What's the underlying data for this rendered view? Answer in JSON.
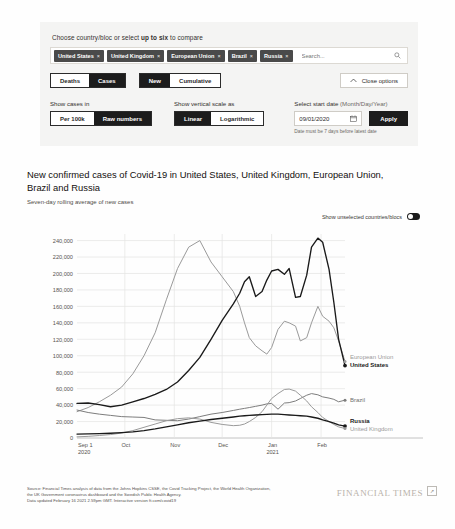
{
  "options": {
    "heading_prefix": "Choose country/bloc or select ",
    "heading_bold": "up to six",
    "heading_suffix": " to compare",
    "chips": [
      {
        "label": "United States",
        "remove": "×"
      },
      {
        "label": "United Kingdom",
        "remove": "×"
      },
      {
        "label": "European Union",
        "remove": "×"
      },
      {
        "label": "Brazil",
        "remove": "×"
      },
      {
        "label": "Russia",
        "remove": "×"
      }
    ],
    "search_placeholder": "Search...",
    "search_value": "",
    "metric_toggle": {
      "options": [
        "Deaths",
        "Cases"
      ],
      "selected": "Cases"
    },
    "count_toggle": {
      "options": [
        "New",
        "Cumulative"
      ],
      "selected": "New"
    },
    "close_options_label": "Close options",
    "show_cases_label": "Show cases in",
    "cases_toggle": {
      "options": [
        "Per 100k",
        "Raw numbers"
      ],
      "selected": "Raw numbers"
    },
    "scale_label": "Show vertical scale as",
    "scale_toggle": {
      "options": [
        "Linear",
        "Logarithmic"
      ],
      "selected": "Linear"
    },
    "date_label": "Select start date",
    "date_label_sub": "(Month/Day/Year)",
    "date_value": "09/01/2020",
    "apply_label": "Apply",
    "date_hint": "Date must be 7 days before latest date"
  },
  "chart_header": {
    "title": "New confirmed cases of Covid-19 in United States, United Kingdom, European Union, Brazil and Russia",
    "subtitle": "Seven-day rolling average of new cases",
    "unselected_toggle_label": "Show unselected countries/blocs",
    "unselected_toggle_state": "on"
  },
  "footer": {
    "source_line1": "Source: Financial Times analysis of data from the Johns Hopkins CSSE, the Covid Tracking Project, the World Health Organization,",
    "source_line2": "the UK Government coronavirus dashboard and the Swedish Public Health Agency.",
    "source_line3": "Data updated February 16 2021 2.59pm GMT. Interactive version ft.com/covid19",
    "brand": "FINANCIAL TIMES",
    "share_icon": "↗"
  },
  "chart_data": {
    "type": "line",
    "title": "New confirmed cases of Covid-19 in United States, United Kingdom, European Union, Brazil and Russia",
    "subtitle": "Seven-day rolling average of new cases",
    "xlabel": "",
    "ylabel": "",
    "grid": true,
    "legend_position": "right-inline",
    "ylim": [
      0,
      248000
    ],
    "yticks": [
      0,
      20000,
      40000,
      60000,
      80000,
      100000,
      120000,
      140000,
      160000,
      180000,
      200000,
      220000,
      240000
    ],
    "ytick_labels": [
      "0",
      "20,000",
      "40,000",
      "60,000",
      "80,000",
      "100,000",
      "120,000",
      "140,000",
      "160,000",
      "180,000",
      "200,000",
      "220,000",
      "240,000"
    ],
    "xticks": [
      0,
      30,
      61,
      91,
      122,
      153
    ],
    "xtick_labels": [
      "Sep 1\n2020",
      "Oct",
      "Nov",
      "Dec",
      "Jan\n2021",
      "Feb"
    ],
    "x_start": "2020-09-01",
    "x_end": "2021-02-16",
    "x_days": 168,
    "series": [
      {
        "name": "United States",
        "color": "#1a1a1a",
        "emphasis": "bold",
        "label_position": "right",
        "end_value": 88000,
        "x": [
          0,
          7,
          14,
          21,
          28,
          35,
          42,
          49,
          56,
          63,
          70,
          77,
          84,
          91,
          98,
          102,
          105,
          108,
          112,
          116,
          119,
          122,
          126,
          130,
          133,
          137,
          140,
          144,
          147,
          151,
          154,
          158,
          161,
          164,
          168
        ],
        "values": [
          42000,
          42500,
          40500,
          38000,
          40000,
          44000,
          48000,
          53000,
          59000,
          68000,
          82000,
          98000,
          120000,
          143000,
          163000,
          176000,
          190000,
          196000,
          172000,
          178000,
          192000,
          203000,
          205000,
          199000,
          206000,
          171000,
          172000,
          198000,
          232000,
          243000,
          238000,
          205000,
          165000,
          120000,
          88000
        ]
      },
      {
        "name": "European Union",
        "color": "#9a9a9a",
        "emphasis": "normal",
        "label_position": "right",
        "end_value": 93000,
        "x": [
          0,
          7,
          14,
          21,
          28,
          35,
          42,
          49,
          56,
          63,
          70,
          77,
          84,
          91,
          98,
          102,
          105,
          108,
          112,
          116,
          119,
          122,
          126,
          130,
          133,
          137,
          140,
          144,
          147,
          151,
          154,
          158,
          161,
          164,
          168
        ],
        "values": [
          32000,
          37000,
          44000,
          52000,
          62000,
          78000,
          100000,
          128000,
          168000,
          206000,
          232000,
          240000,
          214000,
          196000,
          178000,
          160000,
          140000,
          122000,
          112000,
          106000,
          102000,
          110000,
          132000,
          142000,
          140000,
          136000,
          118000,
          122000,
          140000,
          160000,
          148000,
          142000,
          134000,
          118000,
          93000
        ]
      },
      {
        "name": "Brazil",
        "color": "#7d7d7d",
        "emphasis": "normal",
        "label_position": "right",
        "end_value": 46000,
        "x": [
          0,
          7,
          14,
          21,
          28,
          35,
          42,
          49,
          56,
          63,
          70,
          77,
          84,
          91,
          98,
          102,
          105,
          108,
          112,
          116,
          119,
          122,
          126,
          130,
          133,
          137,
          140,
          144,
          147,
          151,
          154,
          158,
          161,
          164,
          168
        ],
        "values": [
          34000,
          31000,
          29000,
          27500,
          26000,
          25500,
          25000,
          22000,
          21500,
          21000,
          23000,
          26000,
          29000,
          31000,
          33500,
          35000,
          36000,
          37000,
          38500,
          40000,
          41500,
          42000,
          35000,
          42500,
          43000,
          45000,
          48000,
          52000,
          54000,
          52500,
          50000,
          48500,
          47000,
          44000,
          46000
        ]
      },
      {
        "name": "Russia",
        "color": "#1a1a1a",
        "emphasis": "bold",
        "label_position": "right",
        "end_value": 14500,
        "x": [
          0,
          7,
          14,
          21,
          28,
          35,
          42,
          49,
          56,
          63,
          70,
          77,
          84,
          91,
          98,
          102,
          105,
          108,
          112,
          116,
          119,
          122,
          126,
          130,
          133,
          137,
          140,
          144,
          147,
          151,
          154,
          158,
          161,
          164,
          168
        ],
        "values": [
          4800,
          5000,
          5300,
          5800,
          6500,
          7500,
          9000,
          11000,
          13500,
          16000,
          18500,
          20500,
          22500,
          24000,
          25500,
          26500,
          27000,
          27500,
          28000,
          28500,
          28800,
          29000,
          29000,
          28500,
          28000,
          27500,
          27000,
          26500,
          25500,
          24000,
          22000,
          20000,
          18000,
          16000,
          14500
        ]
      },
      {
        "name": "United Kingdom",
        "color": "#9a9a9a",
        "emphasis": "normal",
        "label_position": "right",
        "end_value": 11500,
        "x": [
          0,
          7,
          14,
          21,
          28,
          35,
          42,
          49,
          56,
          63,
          70,
          77,
          84,
          91,
          98,
          102,
          105,
          108,
          112,
          116,
          119,
          122,
          126,
          130,
          133,
          137,
          140,
          144,
          147,
          151,
          154,
          158,
          161,
          164,
          168
        ],
        "values": [
          1400,
          2000,
          3000,
          4200,
          6000,
          9000,
          13000,
          17000,
          21000,
          23500,
          24500,
          23000,
          19000,
          16500,
          15000,
          15500,
          17000,
          20000,
          25000,
          32000,
          40000,
          48000,
          54000,
          59000,
          59500,
          57000,
          52000,
          45000,
          38000,
          31000,
          25000,
          20000,
          16500,
          13500,
          11500
        ]
      }
    ]
  }
}
